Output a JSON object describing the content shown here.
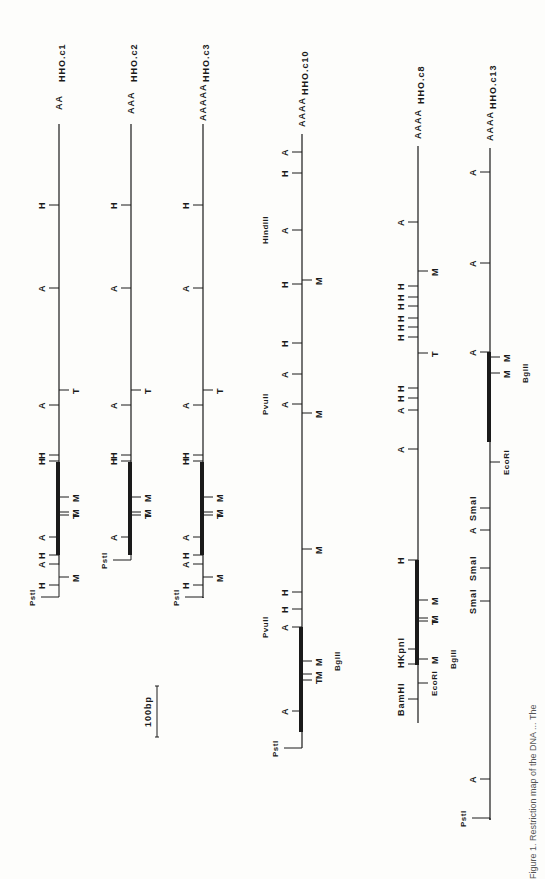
{
  "figure": {
    "caption": "Figure 1. Restriction map of the DNA ... The",
    "scale_bar": {
      "label": "100bp",
      "x": 157,
      "y_top": 686,
      "y_bottom": 737
    },
    "colors": {
      "ink": "#1a1a1a",
      "paper": "#fdfdfb"
    }
  },
  "clones": [
    {
      "name": "HHO.c1",
      "poly_a": "AA",
      "x": 59,
      "y_top": 124,
      "y_bottom": 565,
      "thick": {
        "y1": 462,
        "y2": 555
      },
      "sites": [
        {
          "label": "H",
          "side": "left",
          "y": 205
        },
        {
          "label": "A",
          "side": "left",
          "y": 288
        },
        {
          "label": "A",
          "side": "left",
          "y": 405
        },
        {
          "label": "T",
          "side": "right",
          "y": 390
        },
        {
          "label": "H",
          "side": "left",
          "y": 455
        },
        {
          "label": "H",
          "side": "left",
          "y": 461
        },
        {
          "label": "M",
          "side": "right",
          "y": 497
        },
        {
          "label": "M",
          "side": "right",
          "y": 512
        },
        {
          "label": "T",
          "side": "right",
          "y": 515
        },
        {
          "label": "A",
          "side": "left",
          "y": 537
        },
        {
          "label": "H",
          "side": "left",
          "y": 555
        },
        {
          "label": "A",
          "side": "left",
          "y": 564
        },
        {
          "label": "M",
          "side": "right",
          "y": 577
        },
        {
          "label": "H",
          "side": "left",
          "y": 585
        }
      ],
      "pst": {
        "label": "PstI",
        "y": 597
      }
    },
    {
      "name": "HHO.c2",
      "poly_a": "AAA",
      "x": 131,
      "y_top": 124,
      "y_bottom": 555,
      "thick": {
        "y1": 462,
        "y2": 555
      },
      "sites": [
        {
          "label": "H",
          "side": "left",
          "y": 205
        },
        {
          "label": "A",
          "side": "left",
          "y": 288
        },
        {
          "label": "A",
          "side": "left",
          "y": 405
        },
        {
          "label": "T",
          "side": "right",
          "y": 390
        },
        {
          "label": "H",
          "side": "left",
          "y": 455
        },
        {
          "label": "H",
          "side": "left",
          "y": 461
        },
        {
          "label": "M",
          "side": "right",
          "y": 497
        },
        {
          "label": "M",
          "side": "right",
          "y": 512
        },
        {
          "label": "T",
          "side": "right",
          "y": 515
        },
        {
          "label": "A",
          "side": "left",
          "y": 537
        }
      ],
      "pst": {
        "label": "PstI",
        "y": 560
      }
    },
    {
      "name": "HHO.c3",
      "poly_a": "AAAAA",
      "x": 203,
      "y_top": 124,
      "y_bottom": 598,
      "thick": {
        "y1": 462,
        "y2": 555
      },
      "sites": [
        {
          "label": "H",
          "side": "left",
          "y": 205
        },
        {
          "label": "A",
          "side": "left",
          "y": 288
        },
        {
          "label": "A",
          "side": "left",
          "y": 405
        },
        {
          "label": "T",
          "side": "right",
          "y": 390
        },
        {
          "label": "H",
          "side": "left",
          "y": 455
        },
        {
          "label": "H",
          "side": "left",
          "y": 461
        },
        {
          "label": "M",
          "side": "right",
          "y": 497
        },
        {
          "label": "M",
          "side": "right",
          "y": 512
        },
        {
          "label": "T",
          "side": "right",
          "y": 515
        },
        {
          "label": "A",
          "side": "left",
          "y": 537
        },
        {
          "label": "H",
          "side": "left",
          "y": 555
        },
        {
          "label": "A",
          "side": "left",
          "y": 564
        },
        {
          "label": "M",
          "side": "right",
          "y": 577
        },
        {
          "label": "H",
          "side": "left",
          "y": 585
        }
      ],
      "pst": {
        "label": "PstI",
        "y": 597
      }
    },
    {
      "name": "HHO.c10",
      "poly_a": "AAAA",
      "x": 302,
      "y_top": 134,
      "y_bottom": 748,
      "thick": {
        "y1": 627,
        "y2": 732
      },
      "sites": [
        {
          "label": "A",
          "side": "left",
          "y": 152
        },
        {
          "label": "H",
          "side": "left",
          "y": 173
        },
        {
          "label": "A",
          "side": "left",
          "y": 230
        },
        {
          "label": "HindIII",
          "side": "left",
          "y": 230,
          "text_only": true
        },
        {
          "label": "H",
          "side": "left",
          "y": 284
        },
        {
          "label": "M",
          "side": "right",
          "y": 280
        },
        {
          "label": "H",
          "side": "left",
          "y": 343
        },
        {
          "label": "A",
          "side": "left",
          "y": 374
        },
        {
          "label": "A",
          "side": "left",
          "y": 404
        },
        {
          "label": "PvuII",
          "side": "left",
          "y": 404,
          "text_only": true
        },
        {
          "label": "M",
          "side": "right",
          "y": 413
        },
        {
          "label": "M",
          "side": "right",
          "y": 549
        },
        {
          "label": "H",
          "side": "left",
          "y": 592
        },
        {
          "label": "H",
          "side": "left",
          "y": 609
        },
        {
          "label": "A",
          "side": "left",
          "y": 627
        },
        {
          "label": "PvuII",
          "side": "left",
          "y": 627,
          "text_only": true
        },
        {
          "label": "M",
          "side": "right",
          "y": 661
        },
        {
          "label": "BglII",
          "side": "right",
          "y": 661,
          "text_only": true
        },
        {
          "label": "M",
          "side": "right",
          "y": 674
        },
        {
          "label": "T",
          "side": "right",
          "y": 680
        },
        {
          "label": "A",
          "side": "left",
          "y": 711
        }
      ],
      "pst": {
        "label": "PstI",
        "y": 748
      }
    },
    {
      "name": "HHO.c8",
      "poly_a": "AAAA",
      "x": 418,
      "y_top": 146,
      "y_bottom": 723,
      "thick": {
        "y1": 560,
        "y2": 665
      },
      "sites": [
        {
          "label": "A",
          "side": "left",
          "y": 222
        },
        {
          "label": "M",
          "side": "right",
          "y": 271
        },
        {
          "label": "H",
          "side": "left",
          "y": 286
        },
        {
          "label": "H",
          "side": "left",
          "y": 297
        },
        {
          "label": "H",
          "side": "left",
          "y": 306
        },
        {
          "label": "H",
          "side": "left",
          "y": 318
        },
        {
          "label": "H",
          "side": "left",
          "y": 327
        },
        {
          "label": "H",
          "side": "left",
          "y": 337
        },
        {
          "label": "T",
          "side": "right",
          "y": 353
        },
        {
          "label": "H",
          "side": "left",
          "y": 388
        },
        {
          "label": "H",
          "side": "left",
          "y": 398
        },
        {
          "label": "A",
          "side": "left",
          "y": 410
        },
        {
          "label": "A",
          "side": "left",
          "y": 449
        },
        {
          "label": "H",
          "side": "left",
          "y": 560
        },
        {
          "label": "M",
          "side": "right",
          "y": 600
        },
        {
          "label": "M",
          "side": "right",
          "y": 618
        },
        {
          "label": "T",
          "side": "right",
          "y": 621
        },
        {
          "label": "KpnI",
          "side": "left",
          "y": 649
        },
        {
          "label": "H",
          "side": "left",
          "y": 664
        },
        {
          "label": "M",
          "side": "right",
          "y": 659
        },
        {
          "label": "BglII",
          "side": "right",
          "y": 659,
          "text_only": true
        },
        {
          "label": "EcoRI",
          "side": "right",
          "y": 683
        },
        {
          "label": "BamHI",
          "side": "left",
          "y": 699
        }
      ],
      "pst": null
    },
    {
      "name": "HHO.c13",
      "poly_a": "AAAA",
      "x": 490,
      "y_top": 148,
      "y_bottom": 820,
      "thick": {
        "y1": 352,
        "y2": 442
      },
      "sites": [
        {
          "label": "A",
          "side": "left",
          "y": 172
        },
        {
          "label": "A",
          "side": "left",
          "y": 263
        },
        {
          "label": "A",
          "side": "left",
          "y": 352
        },
        {
          "label": "M",
          "side": "right",
          "y": 357
        },
        {
          "label": "M",
          "side": "right",
          "y": 373
        },
        {
          "label": "BglII",
          "side": "right",
          "y": 373,
          "text_only": true
        },
        {
          "label": "EcoRI",
          "side": "right",
          "y": 462
        },
        {
          "label": "SmaI",
          "side": "left",
          "y": 508
        },
        {
          "label": "A",
          "side": "left",
          "y": 530
        },
        {
          "label": "SmaI",
          "side": "left",
          "y": 568
        },
        {
          "label": "SmaI",
          "side": "left",
          "y": 601
        },
        {
          "label": "A",
          "side": "left",
          "y": 779
        }
      ],
      "pst": {
        "label": "PstI",
        "y": 818
      }
    }
  ]
}
